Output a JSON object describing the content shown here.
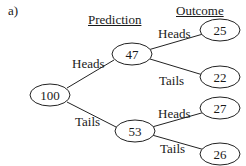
{
  "panel_label": "a)",
  "headers": {
    "prediction": "Prediction",
    "outcome": "Outcome"
  },
  "nodes": {
    "root": "100",
    "pred_heads": "47",
    "pred_tails": "53",
    "out_hh": "25",
    "out_ht": "22",
    "out_th": "27",
    "out_tt": "26"
  },
  "edges": {
    "root_heads": "Heads",
    "root_tails": "Tails",
    "heads_heads": "Heads",
    "heads_tails": "Tails",
    "tails_heads": "Heads",
    "tails_tails": "Tails"
  }
}
